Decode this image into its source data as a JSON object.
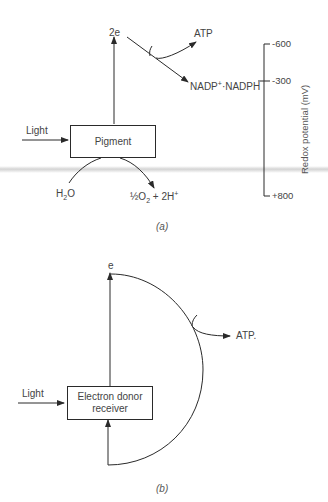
{
  "diagram": {
    "panel_a": {
      "caption": "(a)",
      "electron_label": "2e",
      "atp_label": "ATP",
      "nadp_label_prefix": "NADP",
      "nadp_label_sup": "+",
      "nadp_label_suffix": "·NADPH",
      "light_label": "Light",
      "box_label": "Pigment",
      "water_label_main": "H",
      "water_label_sub": "2",
      "water_label_end": "O",
      "product_label_frac": "½",
      "product_label_o": "O",
      "product_label_o_sub": "2",
      "product_label_plus": " + 2H",
      "product_label_sup": "+",
      "scale": {
        "axis_title": "Redox potential (mV)",
        "ticks": [
          {
            "label": "-600",
            "value": -600
          },
          {
            "label": "-300",
            "value": -300
          },
          {
            "label": "+800",
            "value": 800
          }
        ]
      }
    },
    "panel_b": {
      "caption": "(b)",
      "electron_label": "e",
      "atp_label": "ATP.",
      "light_label": "Light",
      "box_label_line1": "Electron donor",
      "box_label_line2": "receiver"
    },
    "colors": {
      "line": "#2a2a2a",
      "text": "#444444",
      "background": "#ffffff"
    }
  }
}
